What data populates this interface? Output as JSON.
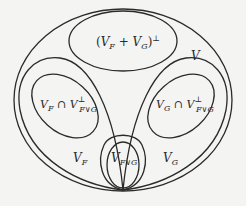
{
  "diagram": {
    "type": "nested-set-diagram",
    "colors": {
      "background": "#f4f4f2",
      "stroke": "#2a2a2a"
    },
    "regions": {
      "outer": {
        "label_main": "V"
      },
      "top": {
        "open": "(",
        "v1": "V",
        "s1": "F",
        "plus": " + ",
        "v2": "V",
        "s2": "G",
        "close": ")",
        "perp": "⊥"
      },
      "left_inner": {
        "v1": "V",
        "s1": "F",
        "cap": " ∩ ",
        "v2": "V",
        "s2": "F∨G",
        "perp": "⊥"
      },
      "right_inner": {
        "v1": "V",
        "s1": "G",
        "cap": " ∩ ",
        "v2": "V",
        "s2": "F∨G",
        "perp": "⊥"
      },
      "left": {
        "v": "V",
        "s": "F"
      },
      "right": {
        "v": "V",
        "s": "G"
      },
      "bottom": {
        "v": "V",
        "s": "F∨G"
      }
    }
  }
}
